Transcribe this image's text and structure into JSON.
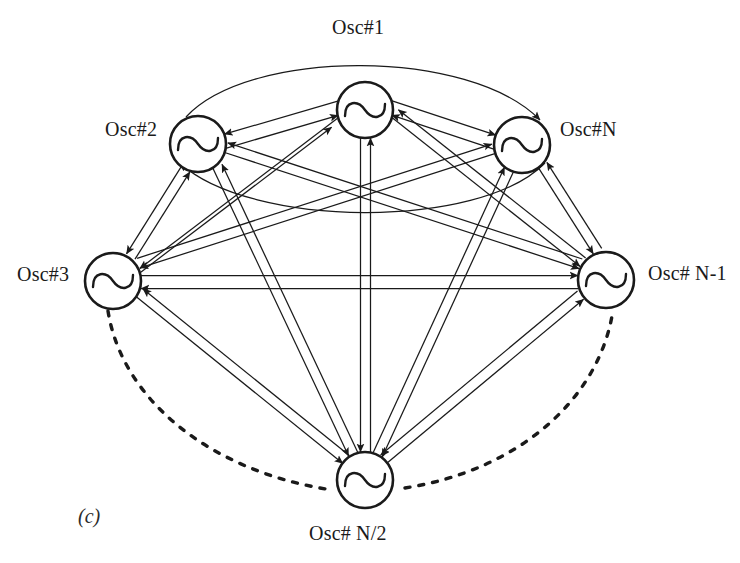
{
  "figure": {
    "caption_letter": "(c)",
    "stroke_color": "#1a1a1a",
    "background_color": "#ffffff"
  },
  "nodes": [
    {
      "id": "osc1",
      "label": "Osc#1",
      "cx": 365,
      "cy": 110,
      "r": 28,
      "label_position": "above",
      "icon": "sine-wave-icon"
    },
    {
      "id": "osc2",
      "label": "Osc#2",
      "cx": 198,
      "cy": 144,
      "r": 28,
      "label_position": "left",
      "icon": "sine-wave-icon"
    },
    {
      "id": "oscN",
      "label": "Osc#N",
      "cx": 522,
      "cy": 145,
      "r": 28,
      "label_position": "right",
      "icon": "sine-wave-icon"
    },
    {
      "id": "osc3",
      "label": "Osc#3",
      "cx": 113,
      "cy": 281,
      "r": 28,
      "label_position": "left",
      "icon": "sine-wave-icon"
    },
    {
      "id": "oscN1",
      "label": "Osc# N-1",
      "cx": 606,
      "cy": 280,
      "r": 28,
      "label_position": "right",
      "icon": "sine-wave-icon"
    },
    {
      "id": "oscN2",
      "label": "Osc# N/2",
      "cx": 365,
      "cy": 480,
      "r": 28,
      "label_position": "below",
      "icon": "sine-wave-icon"
    }
  ],
  "edges": {
    "style": "bidirectional-double-line-with-arrowheads",
    "pairs": [
      [
        "osc1",
        "osc2"
      ],
      [
        "osc1",
        "oscN"
      ],
      [
        "osc1",
        "osc3"
      ],
      [
        "osc1",
        "oscN1"
      ],
      [
        "osc1",
        "oscN2"
      ],
      [
        "osc2",
        "oscN"
      ],
      [
        "osc2",
        "osc3"
      ],
      [
        "osc2",
        "oscN1"
      ],
      [
        "osc2",
        "oscN2"
      ],
      [
        "oscN",
        "osc3"
      ],
      [
        "oscN",
        "oscN1"
      ],
      [
        "oscN",
        "oscN2"
      ],
      [
        "osc3",
        "oscN1"
      ],
      [
        "osc3",
        "oscN2"
      ],
      [
        "oscN1",
        "oscN2"
      ]
    ],
    "curved_pairs": [
      [
        "osc2",
        "oscN"
      ]
    ],
    "dashed_continuation_arcs": [
      {
        "from": "osc3",
        "to": "oscN2",
        "style": "dotted"
      },
      {
        "from": "oscN2",
        "to": "oscN1",
        "style": "dotted"
      }
    ]
  }
}
